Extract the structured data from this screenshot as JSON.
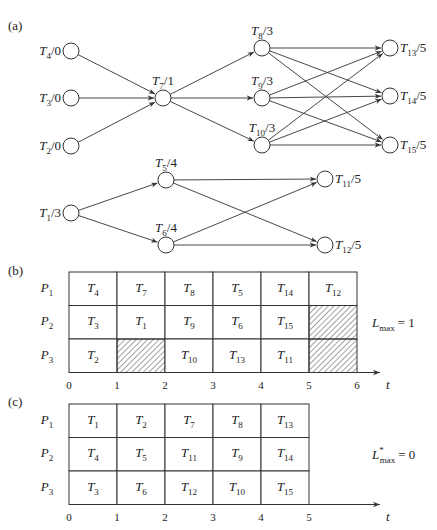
{
  "panels": {
    "a": {
      "label": "(a)"
    },
    "b": {
      "label": "(b)"
    },
    "c": {
      "label": "(c)"
    }
  },
  "graph": {
    "nodes": [
      {
        "id": "T4",
        "name": "T",
        "sub": "4",
        "d": "/0",
        "x": 71,
        "y": 51,
        "label_side": "left"
      },
      {
        "id": "T3",
        "name": "T",
        "sub": "3",
        "d": "/0",
        "x": 71,
        "y": 98,
        "label_side": "left"
      },
      {
        "id": "T2",
        "name": "T",
        "sub": "2",
        "d": "/0",
        "x": 71,
        "y": 146,
        "label_side": "left"
      },
      {
        "id": "T7",
        "name": "T",
        "sub": "7",
        "d": "/1",
        "x": 163,
        "y": 98,
        "label_side": "top"
      },
      {
        "id": "T8",
        "name": "T",
        "sub": "8",
        "d": "/3",
        "x": 262,
        "y": 48,
        "label_side": "top"
      },
      {
        "id": "T9",
        "name": "T",
        "sub": "9",
        "d": "/3",
        "x": 262,
        "y": 98,
        "label_side": "top"
      },
      {
        "id": "T10",
        "name": "T",
        "sub": "10",
        "d": "/3",
        "x": 262,
        "y": 145,
        "label_side": "top"
      },
      {
        "id": "T13",
        "name": "T",
        "sub": "13",
        "d": "/5",
        "x": 390,
        "y": 48,
        "label_side": "right"
      },
      {
        "id": "T14",
        "name": "T",
        "sub": "14",
        "d": "/5",
        "x": 390,
        "y": 96,
        "label_side": "right"
      },
      {
        "id": "T15",
        "name": "T",
        "sub": "15",
        "d": "/5",
        "x": 390,
        "y": 145,
        "label_side": "right"
      },
      {
        "id": "T1",
        "name": "T",
        "sub": "1",
        "d": "/3",
        "x": 71,
        "y": 213,
        "label_side": "left"
      },
      {
        "id": "T5",
        "name": "T",
        "sub": "5",
        "d": "/4",
        "x": 166,
        "y": 180,
        "label_side": "top"
      },
      {
        "id": "T6",
        "name": "T",
        "sub": "6",
        "d": "/4",
        "x": 166,
        "y": 245,
        "label_side": "top"
      },
      {
        "id": "T11",
        "name": "T",
        "sub": "11",
        "d": "/5",
        "x": 325,
        "y": 179,
        "label_side": "right"
      },
      {
        "id": "T12",
        "name": "T",
        "sub": "12",
        "d": "/5",
        "x": 325,
        "y": 245,
        "label_side": "right"
      }
    ],
    "edges": [
      [
        "T4",
        "T7"
      ],
      [
        "T3",
        "T7"
      ],
      [
        "T2",
        "T7"
      ],
      [
        "T7",
        "T8"
      ],
      [
        "T7",
        "T9"
      ],
      [
        "T7",
        "T10"
      ],
      [
        "T8",
        "T13"
      ],
      [
        "T8",
        "T14"
      ],
      [
        "T8",
        "T15"
      ],
      [
        "T9",
        "T13"
      ],
      [
        "T9",
        "T14"
      ],
      [
        "T9",
        "T15"
      ],
      [
        "T10",
        "T13"
      ],
      [
        "T10",
        "T14"
      ],
      [
        "T10",
        "T15"
      ],
      [
        "T1",
        "T5"
      ],
      [
        "T1",
        "T6"
      ],
      [
        "T5",
        "T11"
      ],
      [
        "T5",
        "T12"
      ],
      [
        "T6",
        "T11"
      ],
      [
        "T6",
        "T12"
      ]
    ]
  },
  "schedule_b": {
    "processors": [
      "P1",
      "P2",
      "P3"
    ],
    "proc_labels": [
      {
        "name": "P",
        "sub": "1"
      },
      {
        "name": "P",
        "sub": "2"
      },
      {
        "name": "P",
        "sub": "3"
      }
    ],
    "rows": [
      [
        {
          "t": "T",
          "s": "4"
        },
        {
          "t": "T",
          "s": "7"
        },
        {
          "t": "T",
          "s": "8"
        },
        {
          "t": "T",
          "s": "5"
        },
        {
          "t": "T",
          "s": "14"
        },
        {
          "t": "T",
          "s": "12"
        }
      ],
      [
        {
          "t": "T",
          "s": "3"
        },
        {
          "t": "T",
          "s": "1"
        },
        {
          "t": "T",
          "s": "9"
        },
        {
          "t": "T",
          "s": "6"
        },
        {
          "t": "T",
          "s": "15"
        },
        {
          "idle": true
        }
      ],
      [
        {
          "t": "T",
          "s": "2"
        },
        {
          "idle": true
        },
        {
          "t": "T",
          "s": "10"
        },
        {
          "t": "T",
          "s": "13"
        },
        {
          "t": "T",
          "s": "11"
        },
        {
          "idle": true
        }
      ]
    ],
    "ticks": [
      "0",
      "1",
      "2",
      "3",
      "4",
      "5",
      "6"
    ],
    "axis_label": "t",
    "result": {
      "name": "L",
      "sub": "max",
      "star": "",
      "value": "= 1"
    }
  },
  "schedule_c": {
    "processors": [
      "P1",
      "P2",
      "P3"
    ],
    "proc_labels": [
      {
        "name": "P",
        "sub": "1"
      },
      {
        "name": "P",
        "sub": "2"
      },
      {
        "name": "P",
        "sub": "3"
      }
    ],
    "rows": [
      [
        {
          "t": "T",
          "s": "1"
        },
        {
          "t": "T",
          "s": "2"
        },
        {
          "t": "T",
          "s": "7"
        },
        {
          "t": "T",
          "s": "8"
        },
        {
          "t": "T",
          "s": "13"
        }
      ],
      [
        {
          "t": "T",
          "s": "4"
        },
        {
          "t": "T",
          "s": "5"
        },
        {
          "t": "T",
          "s": "11"
        },
        {
          "t": "T",
          "s": "9"
        },
        {
          "t": "T",
          "s": "14"
        }
      ],
      [
        {
          "t": "T",
          "s": "3"
        },
        {
          "t": "T",
          "s": "6"
        },
        {
          "t": "T",
          "s": "12"
        },
        {
          "t": "T",
          "s": "10"
        },
        {
          "t": "T",
          "s": "15"
        }
      ]
    ],
    "ticks": [
      "0",
      "1",
      "2",
      "3",
      "4",
      "5"
    ],
    "axis_label": "t",
    "result": {
      "name": "L",
      "sub": "max",
      "star": "*",
      "value": "= 0"
    }
  },
  "colors": {
    "stroke": "#333333",
    "text": "#222222",
    "hatch": "#444444",
    "background": "#ffffff"
  }
}
